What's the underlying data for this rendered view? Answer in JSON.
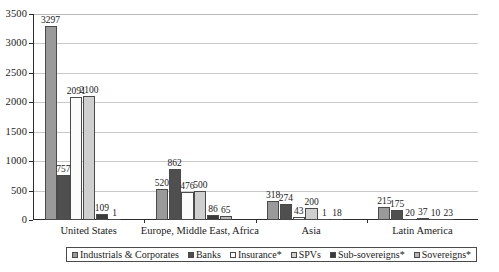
{
  "chart_data": {
    "type": "bar",
    "title": "",
    "xlabel": "",
    "ylabel": "",
    "ylim": [
      0,
      3500
    ],
    "ytick_step": 500,
    "yticks": [
      "0",
      "500",
      "1000",
      "1500",
      "2000",
      "2500",
      "3000",
      "3500"
    ],
    "grid": true,
    "legend_position": "bottom",
    "categories": [
      "United States",
      "Europe, Middle East, Africa",
      "Asia",
      "Latin America"
    ],
    "series": [
      {
        "name": "Industrials & Corporates",
        "color": "#9a9a9a",
        "values": [
          3297,
          520,
          318,
          215
        ]
      },
      {
        "name": "Banks",
        "color": "#4f4f4f",
        "values": [
          757,
          862,
          274,
          175
        ]
      },
      {
        "name": "Insurance*",
        "color": "#fbfbfb",
        "values": [
          2091,
          476,
          43,
          20
        ]
      },
      {
        "name": "SPVs",
        "color": "#cfcfcf",
        "values": [
          2100,
          500,
          200,
          37
        ]
      },
      {
        "name": "Sub-sovereigns*",
        "color": "#3a3a3a",
        "values": [
          109,
          86,
          1,
          10
        ]
      },
      {
        "name": "Sovereigns*",
        "color": "#b5b5b5",
        "values": [
          1,
          65,
          18,
          23
        ]
      }
    ],
    "value_labels": [
      [
        "3297",
        "757",
        "2091",
        "2100",
        "109",
        "1"
      ],
      [
        "520",
        "862",
        "476",
        "500",
        "86",
        "65"
      ],
      [
        "318",
        "274",
        "43",
        "200",
        "1",
        "18"
      ],
      [
        "215",
        "175",
        "20",
        "37",
        "10",
        "23"
      ]
    ]
  },
  "axis": {
    "gridline_color": "#c9c9c9",
    "axis_color": "#2b2b2b"
  }
}
